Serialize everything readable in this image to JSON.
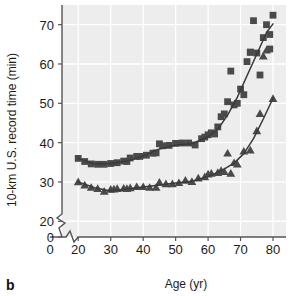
{
  "panel": {
    "label": "b"
  },
  "chart_data": {
    "type": "scatter",
    "title": "",
    "xlabel": "Age (yr)",
    "ylabel": "10-km U.S. record time (min)",
    "xlim": [
      15,
      84
    ],
    "ylim": [
      16,
      75
    ],
    "xticks": [
      0,
      20,
      30,
      40,
      50,
      60,
      70,
      80
    ],
    "yticks": [
      0,
      20,
      30,
      40,
      50,
      60,
      70
    ],
    "axis_break_x": true,
    "axis_break_y": true,
    "grid": true,
    "grid_color": "#ffffff",
    "plot_background": "#ededed",
    "marker_color": "#4a4a4a",
    "line_color": "#3a3a3a",
    "legend": [],
    "series": [
      {
        "name": "men-squares",
        "marker": "square",
        "points": [
          [
            20,
            36.0
          ],
          [
            22,
            35.2
          ],
          [
            24,
            34.6
          ],
          [
            26,
            34.5
          ],
          [
            28,
            34.5
          ],
          [
            30,
            34.7
          ],
          [
            32,
            34.9
          ],
          [
            34,
            35.3
          ],
          [
            35,
            35.2
          ],
          [
            36,
            36.1
          ],
          [
            38,
            36.5
          ],
          [
            39,
            36.5
          ],
          [
            41,
            36.8
          ],
          [
            43,
            37.3
          ],
          [
            44,
            37.4
          ],
          [
            45,
            39.7
          ],
          [
            46,
            39.2
          ],
          [
            48,
            39.3
          ],
          [
            50,
            39.8
          ],
          [
            52,
            39.9
          ],
          [
            54,
            39.9
          ],
          [
            56,
            39.4
          ],
          [
            58,
            41.0
          ],
          [
            59,
            41.4
          ],
          [
            60,
            42.0
          ],
          [
            61,
            42.5
          ],
          [
            62,
            42.2
          ],
          [
            63,
            44.0
          ],
          [
            64,
            46.6
          ],
          [
            65,
            47.3
          ],
          [
            66,
            50.4
          ],
          [
            67,
            58.2
          ],
          [
            68,
            49.6
          ],
          [
            69,
            50.0
          ],
          [
            70,
            53.6
          ],
          [
            71,
            52.2
          ],
          [
            72,
            60.6
          ],
          [
            73,
            63.0
          ],
          [
            73,
            63.0
          ],
          [
            74,
            71.0
          ],
          [
            75,
            62.8
          ],
          [
            76,
            57.2
          ],
          [
            77,
            66.7
          ],
          [
            78,
            70.0
          ],
          [
            79,
            63.8
          ],
          [
            79,
            67.5
          ],
          [
            80,
            72.4
          ]
        ]
      },
      {
        "name": "women-triangles",
        "marker": "triangle",
        "points": [
          [
            20,
            30.0
          ],
          [
            22,
            29.2
          ],
          [
            24,
            28.6
          ],
          [
            26,
            28.3
          ],
          [
            28,
            27.6
          ],
          [
            30,
            28.1
          ],
          [
            31,
            28.2
          ],
          [
            32,
            28.3
          ],
          [
            34,
            28.4
          ],
          [
            35,
            28.3
          ],
          [
            36,
            28.5
          ],
          [
            38,
            28.8
          ],
          [
            40,
            28.8
          ],
          [
            42,
            28.6
          ],
          [
            44,
            28.6
          ],
          [
            45,
            29.9
          ],
          [
            47,
            29.5
          ],
          [
            49,
            29.5
          ],
          [
            51,
            29.8
          ],
          [
            53,
            30.4
          ],
          [
            55,
            30.1
          ],
          [
            57,
            31.0
          ],
          [
            59,
            31.3
          ],
          [
            60,
            32.0
          ],
          [
            61,
            32.2
          ],
          [
            63,
            32.4
          ],
          [
            64,
            32.9
          ],
          [
            65,
            32.6
          ],
          [
            66,
            37.3
          ],
          [
            67,
            32.2
          ],
          [
            68,
            34.9
          ],
          [
            69,
            34.5
          ],
          [
            71,
            37.8
          ],
          [
            73,
            38.1
          ],
          [
            75,
            43.0
          ],
          [
            76,
            47.4
          ],
          [
            77,
            62.0
          ],
          [
            78,
            63.5
          ],
          [
            80,
            51.2
          ]
        ]
      }
    ],
    "fit_curves": [
      {
        "name": "men-fit",
        "x": [
          20,
          25,
          30,
          35,
          40,
          45,
          50,
          55,
          60,
          63,
          66,
          69,
          72,
          75,
          78,
          80
        ],
        "y": [
          36.0,
          34.6,
          34.7,
          35.3,
          36.6,
          38.4,
          39.4,
          39.7,
          41.5,
          43.4,
          47.0,
          51.5,
          57.0,
          62.5,
          68.0,
          70.2
        ]
      },
      {
        "name": "women-fit",
        "x": [
          20,
          25,
          30,
          35,
          40,
          45,
          50,
          55,
          60,
          64,
          68,
          71,
          74,
          77,
          80
        ],
        "y": [
          30.0,
          28.5,
          27.7,
          28.2,
          28.7,
          29.2,
          29.7,
          30.2,
          31.4,
          32.8,
          34.8,
          37.2,
          41.0,
          46.0,
          51.3
        ]
      }
    ]
  }
}
